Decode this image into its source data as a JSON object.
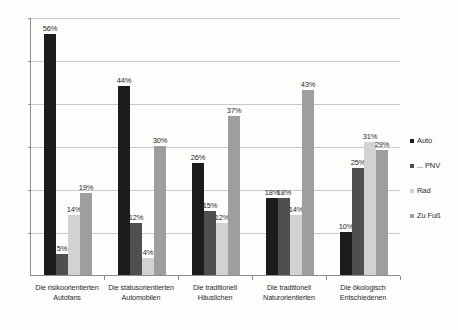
{
  "chart_data": {
    "type": "bar",
    "title": "",
    "subtitle": "",
    "xlabel": "",
    "ylabel": "",
    "ylim": [
      0,
      60
    ],
    "yticks": [
      10,
      20,
      30,
      40,
      50,
      60
    ],
    "ytick_labels": [
      "10",
      "20",
      "30",
      "40",
      "50",
      "60"
    ],
    "grid": true,
    "grid_axis": "y",
    "legend_position": "right",
    "value_label_suffix": "%",
    "categories": [
      "Die risikoorientierten Autofans",
      "Die statusorientierten Automobilen",
      "Die traditionell Häuslichen",
      "Die traditionell Naturorientierten",
      "Die ökologisch Entschiedenen"
    ],
    "category_lines": [
      [
        "Die risikoorientierten",
        "Autofans"
      ],
      [
        "Die statusorientierten",
        "Automobilen"
      ],
      [
        "Die traditionell",
        "Häuslichen"
      ],
      [
        "Die traditionell",
        "Naturorientierten"
      ],
      [
        "Die ökologisch",
        "Entschiedenen"
      ]
    ],
    "series": [
      {
        "name": "Auto",
        "color": "#1c1c1c",
        "values": [
          56,
          44,
          26,
          18,
          10
        ],
        "labels": [
          "56%",
          "44%",
          "26%",
          "18%",
          "10%"
        ]
      },
      {
        "name": "... PNV",
        "color": "#4f4f4f",
        "values": [
          5,
          12,
          15,
          18,
          25
        ],
        "labels": [
          "5%",
          "12%",
          "15%",
          "18%",
          "25%"
        ]
      },
      {
        "name": "Rad",
        "color": "#d2d2d2",
        "values": [
          14,
          4,
          12,
          14,
          31
        ],
        "labels": [
          "14%",
          "4%",
          "12%",
          "14%",
          "31%"
        ]
      },
      {
        "name": "Zu Fuß",
        "color": "#9e9e9e",
        "values": [
          19,
          30,
          37,
          43,
          29
        ],
        "labels": [
          "19%",
          "30%",
          "37%",
          "43%",
          "29%"
        ]
      }
    ]
  },
  "legend": {
    "items": [
      {
        "label": "Auto",
        "color": "#1c1c1c"
      },
      {
        "label": "... PNV",
        "color": "#4f4f4f"
      },
      {
        "label": "Rad",
        "color": "#d2d2d2"
      },
      {
        "label": "Zu Fuß",
        "color": "#9e9e9e"
      }
    ]
  }
}
